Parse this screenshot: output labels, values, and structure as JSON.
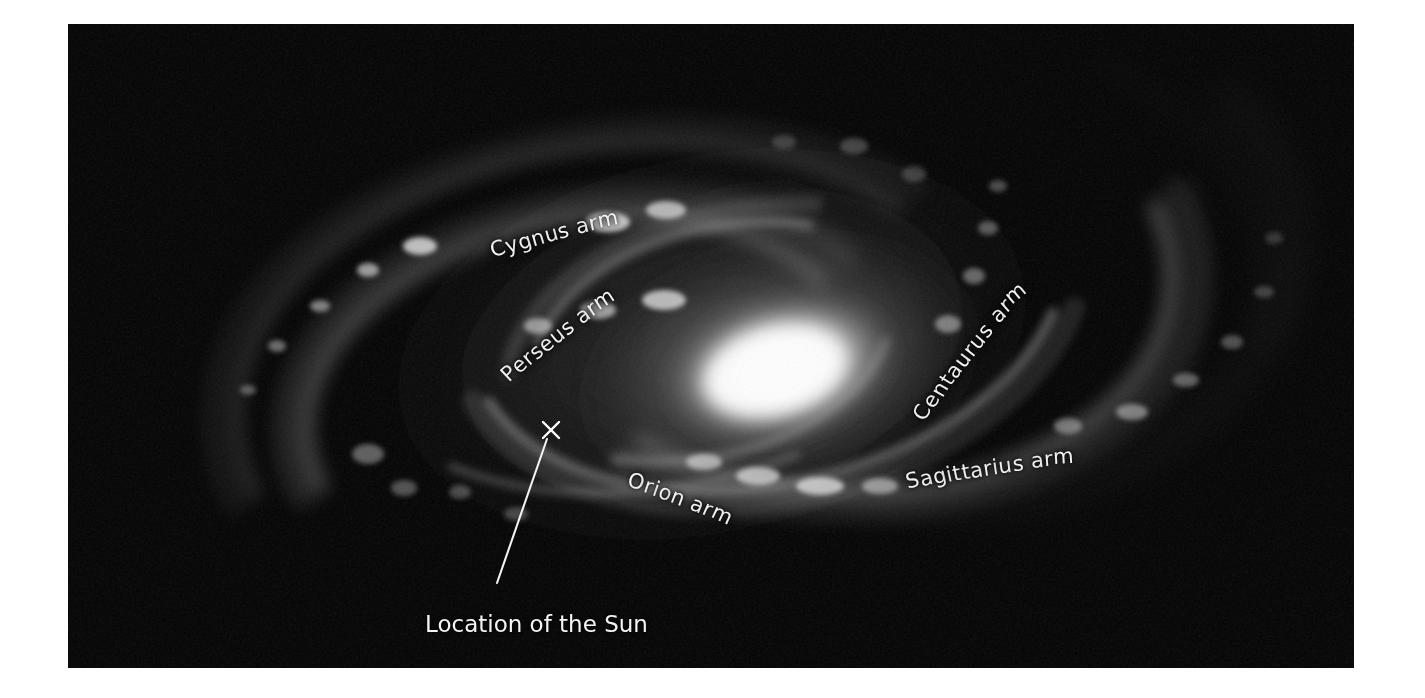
{
  "figure": {
    "kind": "astronomical-illustration",
    "background_color": "#ffffff",
    "plate_color": "#000000",
    "label_color": "#f2f2f2",
    "core_color": "#ffffff",
    "plate": {
      "x": 68,
      "y": 24,
      "width": 1286,
      "height": 644
    }
  },
  "labels": {
    "cygnus": "Cygnus arm",
    "perseus": "Perseus arm",
    "centaurus": "Centaurus arm",
    "sagittarius": "Sagittarius arm",
    "orion": "Orion arm",
    "sun_caption": "Location of the Sun"
  },
  "markers": {
    "sun_marker_glyph": "×",
    "sun_marker_x": 551,
    "sun_marker_y": 430,
    "leader_line_from_x": 547,
    "leader_line_from_y": 439,
    "leader_line_to_x": 497,
    "leader_line_to_y": 583
  },
  "galaxy": {
    "center_x": 712,
    "center_y": 344,
    "bulge_rx": 118,
    "bulge_ry": 70,
    "disk_rx": 470,
    "disk_ry": 270,
    "rotation_deg": -12,
    "arm_count": 4
  }
}
